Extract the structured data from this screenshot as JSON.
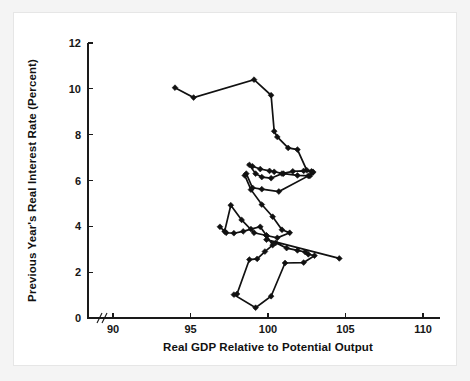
{
  "figure": {
    "background_color": "#ffffff",
    "mat_color": "#f4f4f4",
    "ink_color": "#111111"
  },
  "chart_data": {
    "type": "line",
    "title": "",
    "subtitle": "",
    "xlabel": "Real GDP Relative to Potential Output",
    "ylabel": "Previous Year's Real Interest Rate (Percent)",
    "xlim": [
      88.5,
      111.5
    ],
    "ylim": [
      0,
      12
    ],
    "xticks": [
      90,
      95,
      100,
      105,
      110
    ],
    "xtick_labels": [
      "90",
      "95",
      "100",
      "105",
      "110"
    ],
    "yticks": [
      0,
      2,
      4,
      6,
      8,
      10,
      12
    ],
    "ytick_labels": [
      "0",
      "2",
      "4",
      "6",
      "8",
      "10",
      "12"
    ],
    "grid": false,
    "legend": false,
    "legend_position": "none",
    "axis_break": {
      "axis": "x",
      "symbol": "//",
      "note": "break between origin and first tick"
    },
    "marker": "filled-diamond",
    "connected": true,
    "annotations": [],
    "series": [
      {
        "name": "Real GDP vs previous year's real interest rate",
        "x": [
          94.0,
          95.2,
          99.1,
          100.2,
          100.4,
          100.6,
          101.3,
          101.9,
          102.5,
          102.8,
          102.9,
          102.7,
          101.9,
          101.0,
          100.4,
          100.1,
          99.5,
          99.0,
          98.8,
          99.2,
          99.6,
          100.2,
          100.9,
          101.6,
          102.3,
          102.9,
          102.6,
          100.7,
          99.6,
          99.0,
          98.6,
          98.5,
          98.9,
          99.6,
          100.3,
          100.9,
          101.4,
          100.6,
          99.9,
          99.1,
          98.3,
          97.6,
          97.2,
          96.9,
          97.3,
          97.8,
          98.4,
          98.9,
          99.5,
          99.9,
          100.3,
          99.8,
          99.3,
          98.8,
          98.0,
          97.8,
          99.2,
          100.2,
          101.1,
          102.3,
          103.0,
          102.6,
          102.4,
          101.9,
          101.2,
          100.5,
          99.9,
          104.6
        ],
        "y": [
          10.05,
          9.62,
          10.4,
          9.72,
          8.15,
          7.9,
          7.42,
          7.35,
          6.45,
          6.4,
          6.35,
          6.2,
          6.22,
          6.3,
          6.38,
          6.42,
          6.5,
          6.62,
          6.68,
          6.3,
          6.15,
          6.1,
          6.3,
          6.4,
          6.42,
          6.38,
          6.2,
          5.52,
          5.62,
          5.68,
          6.3,
          6.22,
          5.6,
          4.95,
          4.42,
          3.85,
          3.72,
          3.5,
          3.6,
          3.72,
          4.28,
          4.92,
          3.78,
          3.98,
          3.72,
          3.7,
          3.78,
          3.88,
          3.98,
          3.6,
          3.18,
          2.9,
          2.58,
          2.55,
          1.05,
          1.02,
          0.45,
          0.95,
          2.4,
          2.42,
          2.72,
          2.78,
          2.88,
          2.95,
          3.05,
          3.28,
          3.42,
          2.6
        ]
      }
    ]
  }
}
